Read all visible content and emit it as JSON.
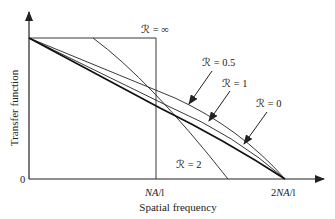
{
  "diagram": {
    "type": "transfer-function-curves",
    "xlabel": "Spatial frequency",
    "ylabel": "Transfer function",
    "y_zero_tick": "0",
    "x_ticks": [
      "NA/l",
      "2NA/l"
    ],
    "x_tick_parts": {
      "na": {
        "italic": "NA",
        "suffix": "/l"
      },
      "two_na": {
        "prefix": "2",
        "italic": "NA",
        "suffix": "/l"
      }
    },
    "curve_labels": {
      "r_inf": "ℛ = ∞",
      "r_05": "ℛ = 0.5",
      "r_1": "ℛ = 1",
      "r_0": "ℛ = 0",
      "r_2": "ℛ = 2"
    },
    "colors": {
      "axis": "#222222",
      "curve": "#222222",
      "background": "#ffffff"
    }
  }
}
